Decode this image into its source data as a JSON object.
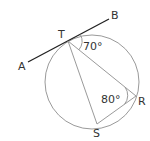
{
  "diagram": {
    "type": "circle-geometry",
    "points": {
      "A": {
        "label": "A"
      },
      "B": {
        "label": "B"
      },
      "T": {
        "label": "T"
      },
      "R": {
        "label": "R"
      },
      "S": {
        "label": "S"
      }
    },
    "angles": {
      "BTR": {
        "label": "70°"
      },
      "TRS": {
        "label": "80°"
      }
    },
    "colors": {
      "tangent_line": "#222222",
      "circle": "#9a9a9a",
      "chords": "#9a9a9a",
      "text": "#333333"
    }
  }
}
